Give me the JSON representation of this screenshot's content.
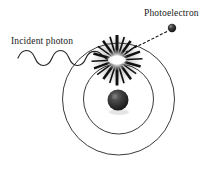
{
  "figure": {
    "title_present": false,
    "background_color": "#ffffff",
    "ink_color": "#1a1a1a",
    "width": 220,
    "height": 170
  },
  "labels": {
    "photoelectron": "Photoelectron",
    "incident_photon": "Incident photon"
  },
  "diagram_data": {
    "type": "physics-schematic",
    "subject": "photoelectric-effect",
    "atom": {
      "center": [
        118.5,
        99
      ],
      "nucleus": {
        "name": "nucleus",
        "center": [
          118,
          100
        ],
        "radius": 10,
        "fill": "#2a2a2a",
        "highlight": "#6a6a6a"
      },
      "shells": [
        {
          "name": "inner-shell",
          "radius": 35,
          "stroke": "#3a3a3a"
        },
        {
          "name": "outer-shell",
          "radius": 56,
          "stroke": "#3a3a3a"
        }
      ]
    },
    "incident_photon_wave": {
      "name": "incident-photon-wave",
      "start": [
        18,
        58
      ],
      "end": [
        113,
        60
      ],
      "cycles": 3,
      "amplitude": 7,
      "stroke": "#2a2a2a"
    },
    "interaction_flash": {
      "name": "starburst-flash",
      "center": [
        117,
        60
      ],
      "outer_radius": 26,
      "spike_count": 20,
      "core_color": "#ffffff",
      "spike_color": "#1a1a1a"
    },
    "photoelectron_particle": {
      "name": "photoelectron",
      "center": [
        172,
        28
      ],
      "radius": 4,
      "fill": "#2a2a2a"
    },
    "ejection_trajectory": {
      "name": "photoelectron-trajectory",
      "start": [
        126,
        52
      ],
      "end": [
        168,
        32
      ],
      "style": "dashed",
      "stroke": "#1a1a1a"
    }
  }
}
